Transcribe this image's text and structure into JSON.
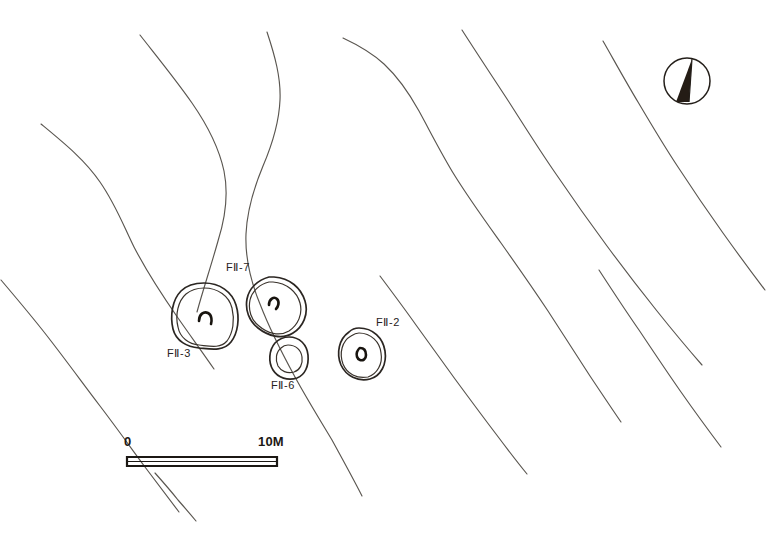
{
  "map": {
    "title": "Archaeological site plan with pit dwelling features and topographic contours",
    "background_color": "#ffffff",
    "contour_color": "#5a5650",
    "feature_color": "#2b2622",
    "label_color": "#27221d",
    "width": 776,
    "height": 534
  },
  "features": [
    {
      "id": "f2-3",
      "label": "FⅡ-3",
      "label_x": 167,
      "label_y": 357,
      "center_x": 204,
      "center_y": 315,
      "shape": "double-oval",
      "has_hearth": true
    },
    {
      "id": "f2-7",
      "label": "FⅡ-7",
      "label_x": 226,
      "label_y": 271,
      "center_x": 274,
      "center_y": 305,
      "shape": "double-rounded-triangle",
      "has_hearth": true
    },
    {
      "id": "f2-6",
      "label": "FⅡ-6",
      "label_x": 271,
      "label_y": 389,
      "center_x": 289,
      "center_y": 356,
      "shape": "double-oval-small",
      "has_hearth": false
    },
    {
      "id": "f2-2",
      "label": "FⅡ-2",
      "label_x": 376,
      "label_y": 326,
      "center_x": 359,
      "center_y": 352,
      "shape": "double-circle",
      "has_hearth": true
    }
  ],
  "scale_bar": {
    "start_label": "0",
    "end_label": "10M",
    "start_label_x": 124,
    "start_label_y": 446,
    "end_label_x": 258,
    "end_label_y": 446,
    "bar_left": 127,
    "bar_right": 277,
    "bar_top": 456,
    "bar_bottom": 466,
    "units": "M",
    "length_value": 10
  },
  "compass": {
    "name": "north-arrow",
    "center_x": 687,
    "center_y": 81,
    "radius": 23,
    "needle_fill": "#241c15",
    "description": "circular north arrow with half-shaded needle"
  },
  "contours": {
    "count": 9,
    "description": "hand-drawn topographic contour lines trending NW-SE",
    "paths": [
      "M 41,124 C 64,143 85,160 100,182 C 116,205 124,227 134,247 C 147,272 162,295 178,318 C 192,338 203,353 214,369",
      "M 140,35 C 158,58 176,80 192,103 C 208,126 219,148 224,171 C 229,196 225,219 218,241 C 211,266 203,290 197,312",
      "M 267,32 C 275,56 281,78 280,100 C 279,124 272,145 263,166 C 253,190 247,212 246,234 C 245,259 251,282 260,304 C 270,330 283,355 295,377 C 307,399 320,420 332,440 C 344,462 354,480 362,496",
      "M 343,38 C 358,45 372,53 384,64 C 398,77 409,93 419,111 C 431,133 442,155 455,176 C 470,200 486,222 501,243 C 518,267 534,290 548,311 C 563,334 577,356 590,376 C 602,394 612,409 621,422",
      "M 462,30 C 478,55 494,79 509,102 C 525,127 540,151 556,174 C 573,199 590,223 607,246 C 624,269 641,291 657,311 C 673,331 688,349 702,365",
      "M 603,41 C 615,62 626,82 638,102 C 651,124 664,146 678,167 C 693,190 708,212 723,233 C 738,254 752,273 765,290",
      "M 1,280 C 18,300 35,320 51,341 C 68,363 84,385 100,406 C 116,427 131,448 145,467 C 158,484 169,499 179,512",
      "M 380,276 C 392,292 404,308 416,325 C 429,343 442,361 455,379 C 469,398 483,417 496,434 C 508,450 518,463 527,474",
      "M 599,270 C 612,290 625,310 639,330 C 653,351 667,372 681,392 C 695,412 709,431 721,447",
      "M 155,473 C 163,482 171,491 178,500 C 185,508 191,515 196,521"
    ]
  }
}
